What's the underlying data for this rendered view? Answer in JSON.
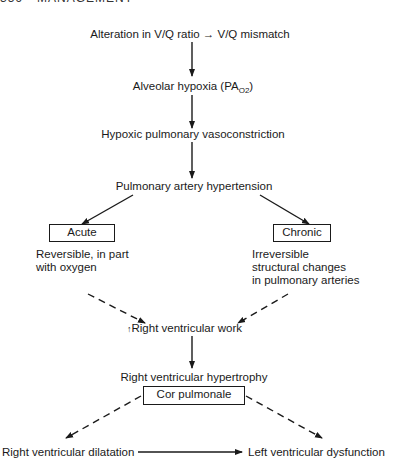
{
  "page_header": {
    "page_number": "356",
    "section": "MANAGEMENT"
  },
  "diagram": {
    "title_node": {
      "prefix": "Alteration in V/Q ratio",
      "arrow": "→",
      "suffix": "V/Q mismatch"
    },
    "nodes": {
      "alveolar_hypoxia": {
        "label": "Alveolar hypoxia (PA",
        "sub": "O2",
        "close": ")"
      },
      "vasoconstriction": "Hypoxic pulmonary vasoconstriction",
      "pulmonary_hypertension": "Pulmonary artery hypertension",
      "acute": "Acute",
      "chronic": "Chronic",
      "acute_note": [
        "Reversible, in part",
        "with oxygen"
      ],
      "chronic_note": [
        "Irreversible",
        "structural changes",
        "in pulmonary arteries"
      ],
      "rv_work": {
        "arrow": "↑",
        "label": "Right ventricular work"
      },
      "rv_hypertrophy": "Right ventricular hypertrophy",
      "cor_pulmonale": "Cor pulmonale",
      "rv_dilatation": "Right ventricular dilatation",
      "lv_dysfunction": "Left ventricular dysfunction"
    },
    "edges": [
      {
        "from": "V/Q mismatch",
        "to": "Alveolar hypoxia",
        "style": "solid"
      },
      {
        "from": "Alveolar hypoxia",
        "to": "Hypoxic pulmonary vasoconstriction",
        "style": "solid"
      },
      {
        "from": "Hypoxic pulmonary vasoconstriction",
        "to": "Pulmonary artery hypertension",
        "style": "solid"
      },
      {
        "from": "Pulmonary artery hypertension",
        "to": "Acute",
        "style": "solid"
      },
      {
        "from": "Pulmonary artery hypertension",
        "to": "Chronic",
        "style": "solid"
      },
      {
        "from": "Acute",
        "to": "Right ventricular work",
        "style": "dashed"
      },
      {
        "from": "Chronic",
        "to": "Right ventricular work",
        "style": "dashed"
      },
      {
        "from": "Right ventricular work",
        "to": "Right ventricular hypertrophy",
        "style": "solid"
      },
      {
        "from": "Cor pulmonale",
        "to": "Right ventricular dilatation",
        "style": "dashed"
      },
      {
        "from": "Cor pulmonale",
        "to": "Left ventricular dysfunction",
        "style": "dashed"
      },
      {
        "from": "Right ventricular dilatation",
        "to": "Left ventricular dysfunction",
        "style": "solid"
      }
    ]
  }
}
